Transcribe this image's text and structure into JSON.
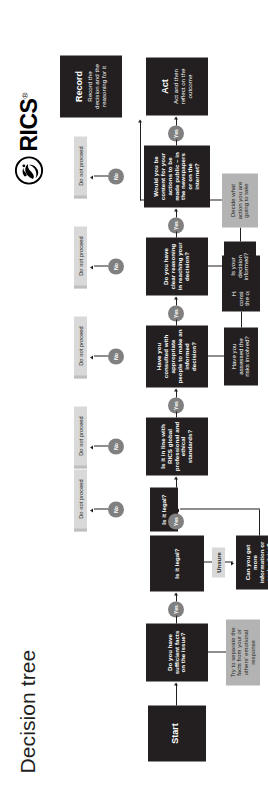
{
  "page": {
    "title": "Decision tree",
    "background": "#ffffff"
  },
  "brand": {
    "name": "RICS",
    "registered_mark": "®",
    "logo_icon": "rics-crest-icon"
  },
  "colors": {
    "dark_node": "#231f20",
    "grey_node": "#b3b3b3",
    "light_grey_node": "#d9d9d9",
    "pill": "#808080",
    "connector": "#231f20"
  },
  "labels": {
    "yes": "Yes",
    "no": "No",
    "unsure": "Unsure",
    "do_not_proceed": "Do not proceed"
  },
  "nodes": {
    "start": {
      "heading": "Start",
      "body": ""
    },
    "q_facts": {
      "text": "Do you have sufficient facts on the issue?"
    },
    "aside_emotions": {
      "text": "Try to separate the facts from your or others' emotional response"
    },
    "q_legal": {
      "text": "Is it legal?"
    },
    "q_more_info": {
      "text": "Can you get more information or seek advice?"
    },
    "q_legal2": {
      "text": "Is it legal?"
    },
    "q_standards": {
      "text": "Is it in line with RICS global professional and ethical standards?"
    },
    "q_consulted": {
      "text": "Have you consulted with appropriate people to make an informed decision?"
    },
    "q_risks": {
      "text": "Have you assessed the risks involved?"
    },
    "q_options": {
      "text": "Have you considered what the options are?"
    },
    "q_reasoning": {
      "text": "Do you have clear reasoning in reaching your decision?"
    },
    "q_informed": {
      "text": "Is your decision informed?"
    },
    "action_decide": {
      "text": "Decide what action you are going to take"
    },
    "q_public": {
      "text": "Would you be content for your actions to be made public – in the newspapers or on the internet?"
    },
    "act": {
      "heading": "Act",
      "body": "Act and then reflect on the outcome"
    },
    "record": {
      "heading": "Record",
      "body": "Record the decision and the reasoning for it"
    }
  },
  "do_not_proceed_count": 6
}
